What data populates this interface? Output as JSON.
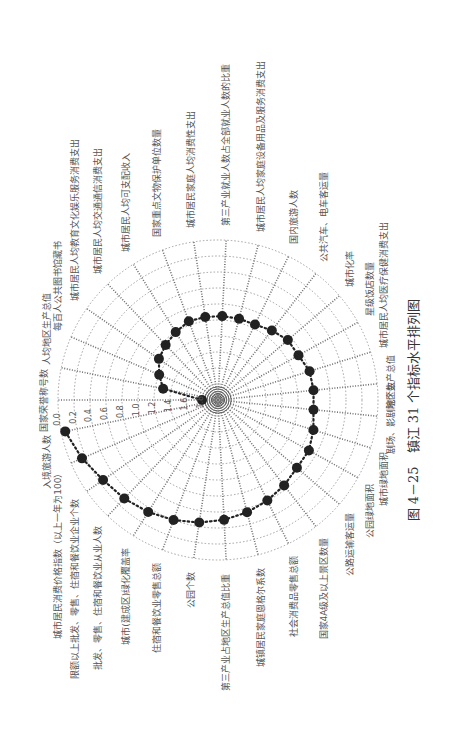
{
  "figure": {
    "caption": "图 4－25　镇江 31 个指标水平排列图",
    "rotation_deg": -90
  },
  "colors": {
    "grid": "#8a8a8a",
    "spoke": "#6f6f6f",
    "series": "#222222",
    "text": "#555555"
  },
  "chart_data": {
    "type": "polar-scatter",
    "title": "镇江 31 个指标水平排列图",
    "radial_axis": {
      "ticks": [
        "0.0",
        "0.2",
        "0.4",
        "0.6",
        "0.8",
        "1.0",
        "1.2",
        "1.4",
        "1.6",
        "1.8"
      ],
      "range": [
        0.0,
        2.0
      ],
      "direction": "outer-to-center",
      "grid": true
    },
    "categories": [
      "国家荣誉称号数",
      "人均地区生产总值",
      "每百人公共图书馆藏书",
      "城市居民人均教育文化娱乐服务消费支出",
      "城市居民人均交通通信消费支出",
      "城市居民人均可支配收入",
      "国家重点文物保护单位数量",
      "城市居民家庭人均消费性支出",
      "第三产业就业人数占全部就业人数的比重",
      "城市居民人均家庭设备用品及服务消费支出",
      "国内旅游人数",
      "公共汽车、电车客运量",
      "城市化率",
      "星级饭店数量",
      "城市居民人均医疗保健消费支出",
      "地区生产总值",
      "剧场、影剧院个数",
      "城市绿地面积",
      "公园绿地面积",
      "公路运输客运量",
      "国家4A级及以上景区数量",
      "社会消费品零售总额",
      "城镇居民家庭恩格尔系数",
      "第三产业占地区生产总值比重",
      "公园个数",
      "住宿和餐饮业零售总额",
      "城市(建成区)绿化覆盖率",
      "批发、零售、住宿和餐饮业从业人数",
      "限额以上批发、零售、住宿和餐饮业企业个数",
      "城市居民消费价格指数（以上一年为100）",
      "入境旅游人数"
    ],
    "series": [
      {
        "name": "镇江",
        "values": [
          1.8,
          1.3,
          1.2,
          1.1,
          1.05,
          1.0,
          0.95,
          0.95,
          0.95,
          0.95,
          0.95,
          0.9,
          0.85,
          0.85,
          0.8,
          0.8,
          0.8,
          0.75,
          0.7,
          0.7,
          0.65,
          0.6,
          0.55,
          0.5,
          0.45,
          0.4,
          0.35,
          0.3,
          0.25,
          0.15,
          0.05
        ]
      }
    ]
  }
}
